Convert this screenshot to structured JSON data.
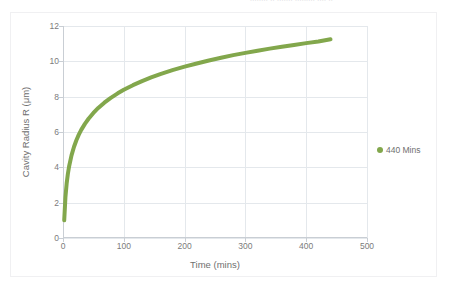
{
  "top_strip": {
    "ghost_text": "........ .. ....... ......... ....    .."
  },
  "chart_data": {
    "type": "line",
    "title": "",
    "subtitle": "",
    "xlabel": "Time (mins)",
    "ylabel": "Cavity Radius R (μm)",
    "xlim": [
      0,
      500
    ],
    "ylim": [
      0,
      12
    ],
    "xticks": [
      0,
      100,
      200,
      300,
      400,
      500
    ],
    "yticks": [
      0,
      2,
      4,
      6,
      8,
      10,
      12
    ],
    "xtick_labels": [
      "0",
      "100",
      "200",
      "300",
      "400",
      "500"
    ],
    "ytick_labels": [
      "0",
      "2",
      "4",
      "6",
      "8",
      "10",
      "12"
    ],
    "grid": true,
    "grid_axis": "both",
    "grid_color": "#e4e8ec",
    "legend_position": "right",
    "series": [
      {
        "name": "440 Mins",
        "color": "#82a74c",
        "line_width": 4,
        "marker": "none",
        "x": [
          2,
          4,
          6,
          8,
          10,
          14,
          18,
          22,
          26,
          30,
          36,
          42,
          50,
          58,
          68,
          78,
          90,
          100,
          115,
          130,
          145,
          160,
          180,
          200,
          220,
          240,
          260,
          280,
          300,
          320,
          340,
          360,
          380,
          400,
          420,
          440
        ],
        "y": [
          1.0,
          2.31,
          3.08,
          3.62,
          4.05,
          4.68,
          5.15,
          5.53,
          5.85,
          6.12,
          6.46,
          6.75,
          7.08,
          7.36,
          7.66,
          7.92,
          8.19,
          8.39,
          8.65,
          8.88,
          9.09,
          9.28,
          9.5,
          9.7,
          9.88,
          10.05,
          10.2,
          10.35,
          10.48,
          10.6,
          10.72,
          10.83,
          10.93,
          11.03,
          11.12,
          11.25
        ],
        "x_start": 2,
        "y_start": 1.0,
        "x_end": 440,
        "y_end": 11.25
      }
    ],
    "legend": [
      {
        "label": "440 Mins",
        "color": "#82a74c",
        "marker": "circle"
      }
    ]
  },
  "colors": {
    "series_green": "#82a74c",
    "grid": "#e4e8ec",
    "axis_text": "#7b7b7b",
    "title_text": "#6f6f6f",
    "frame_border": "#f0f0f2",
    "background": "#ffffff"
  }
}
